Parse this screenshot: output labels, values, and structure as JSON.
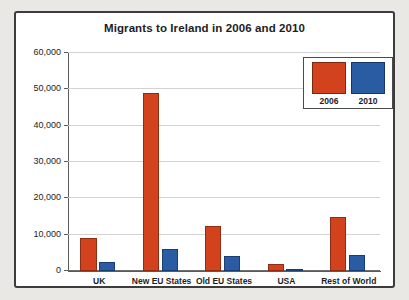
{
  "chart_data": {
    "type": "bar",
    "title": "Migrants to Ireland in 2006 and 2010",
    "xlabel": "",
    "ylabel": "",
    "categories": [
      "UK",
      "New EU States",
      "Old EU States",
      "USA",
      "Rest of World"
    ],
    "series": [
      {
        "name": "2006",
        "color": "#d2431d",
        "values": [
          9000,
          49000,
          12500,
          2000,
          15000
        ]
      },
      {
        "name": "2010",
        "color": "#2a5ca4",
        "values": [
          2500,
          6000,
          4000,
          500,
          4500
        ]
      }
    ],
    "ylim": [
      0,
      60000
    ],
    "ytick_values": [
      0,
      10000,
      20000,
      30000,
      40000,
      50000,
      60000
    ],
    "ytick_labels": [
      "0",
      "10,000",
      "20,000",
      "30,000",
      "40,000",
      "50,000",
      "60,000"
    ],
    "grid": true,
    "legend_position": "top-right"
  },
  "legend": {
    "entries": [
      {
        "label": "2006",
        "color": "#d2431d"
      },
      {
        "label": "2010",
        "color": "#2a5ca4"
      }
    ]
  }
}
